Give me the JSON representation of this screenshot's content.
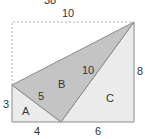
{
  "diagram": {
    "top_cut_label": "38",
    "labels": {
      "top_width": "10",
      "left_height": "3",
      "right_height": "8",
      "bottom_left": "4",
      "bottom_right": "6",
      "hyp_a": "5",
      "hyp_c": "10",
      "region_a": "A",
      "region_b": "B",
      "region_c": "C"
    },
    "colors": {
      "region_a": "#ebebeb",
      "region_b": "#c4c4c4",
      "region_c": "#ebebeb",
      "stroke": "#8a8a8a",
      "dotted": "#b0b0b0"
    }
  }
}
